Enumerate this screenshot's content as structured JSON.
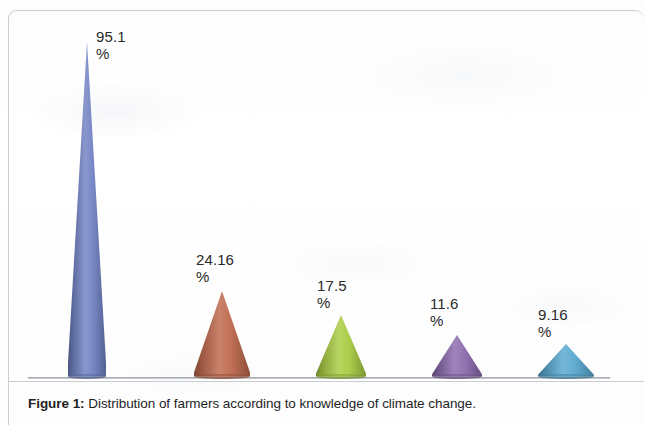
{
  "figure": {
    "caption_label": "Figure 1:",
    "caption_text": " Distribution of farmers according to knowledge of climate change."
  },
  "chart_data": {
    "type": "bar",
    "subtype": "3d-cone",
    "title": "",
    "subtitle": "",
    "xlabel": "",
    "ylabel": "",
    "grid": false,
    "legend": "none",
    "axis": {
      "baseline_visible": true,
      "y_axis_visible": false,
      "tick_labels": []
    },
    "ylim": [
      0,
      100
    ],
    "unit": "%",
    "categories": [
      "",
      "",
      "",
      "",
      ""
    ],
    "values": [
      95.1,
      24.16,
      17.5,
      11.6,
      9.16
    ],
    "point_labels": [
      "95.1",
      "24.16",
      "17.5",
      "11.6",
      "9.16"
    ],
    "percent_sign": "%",
    "series": [
      {
        "name": "Distribution of farmers",
        "values": [
          95.1,
          24.16,
          17.5,
          11.6,
          9.16
        ]
      }
    ],
    "colors": [
      "#7283c4",
      "#bf6a4f",
      "#a9cc45",
      "#8c6cae",
      "#5aa9d0"
    ],
    "color_names": [
      "blue",
      "red-orange",
      "yellow-green",
      "purple",
      "light-blue"
    ]
  }
}
